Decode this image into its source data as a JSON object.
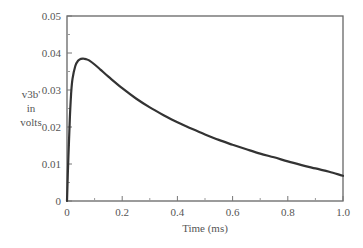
{
  "chart_data": {
    "type": "line",
    "title": "",
    "xlabel": "Time (ms)",
    "ylabel_lines": [
      "v3b'",
      "in",
      "volts"
    ],
    "ylabel": "v3b' in volts",
    "xlim": [
      0,
      1.0
    ],
    "ylim": [
      0,
      0.05
    ],
    "x_ticks": [
      "0",
      "0.2",
      "0.4",
      "0.6",
      "0.8",
      "1.0"
    ],
    "x_tick_values": [
      0,
      0.2,
      0.4,
      0.6,
      0.8,
      1.0
    ],
    "x_minor_ticks": [
      0.1,
      0.3,
      0.5,
      0.7,
      0.9
    ],
    "y_ticks": [
      "0",
      "0.01",
      "0.02",
      "0.03",
      "0.04",
      "0.05"
    ],
    "y_tick_values": [
      0,
      0.01,
      0.02,
      0.03,
      0.04,
      0.05
    ],
    "y_minor_ticks": [
      0.005,
      0.015,
      0.025,
      0.035,
      0.045
    ],
    "grid": false,
    "legend": null,
    "series": [
      {
        "name": "v3b'",
        "color": "#333333",
        "x": [
          0,
          0.005,
          0.01,
          0.015,
          0.02,
          0.03,
          0.04,
          0.05,
          0.06,
          0.07,
          0.08,
          0.1,
          0.12,
          0.15,
          0.2,
          0.25,
          0.3,
          0.35,
          0.4,
          0.45,
          0.5,
          0.55,
          0.6,
          0.65,
          0.7,
          0.75,
          0.8,
          0.85,
          0.9,
          0.95,
          1.0
        ],
        "values": [
          0,
          0.012,
          0.022,
          0.029,
          0.033,
          0.0365,
          0.0379,
          0.0384,
          0.0385,
          0.0383,
          0.038,
          0.0369,
          0.0356,
          0.0336,
          0.0305,
          0.0277,
          0.0253,
          0.0232,
          0.0213,
          0.0196,
          0.018,
          0.0165,
          0.0152,
          0.014,
          0.0128,
          0.0118,
          0.0107,
          0.0097,
          0.0088,
          0.0079,
          0.0068
        ]
      }
    ]
  }
}
